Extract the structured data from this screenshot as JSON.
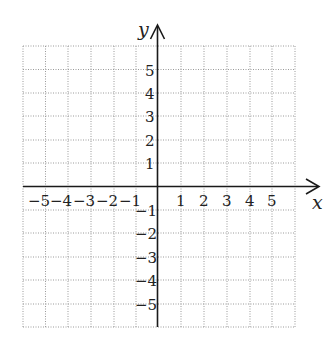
{
  "diagram": {
    "type": "coordinate-plane",
    "x_axis_label": "x",
    "y_axis_label": "y",
    "x_range": [
      -6,
      6
    ],
    "y_range": [
      -6,
      6
    ],
    "grid": "dotted",
    "x_ticks": {
      "neg": [
        "−5",
        "−4",
        "−3",
        "−2",
        "−1"
      ],
      "pos": [
        "1",
        "2",
        "3",
        "4",
        "5"
      ]
    },
    "y_ticks": {
      "pos": [
        "5",
        "4",
        "3",
        "2",
        "1"
      ],
      "neg": [
        "−1",
        "−2",
        "−3",
        "−4",
        "−5"
      ]
    },
    "colors": {
      "axis": "#1a1a1a",
      "grid": "#9a9a9a",
      "text": "#222222"
    }
  }
}
